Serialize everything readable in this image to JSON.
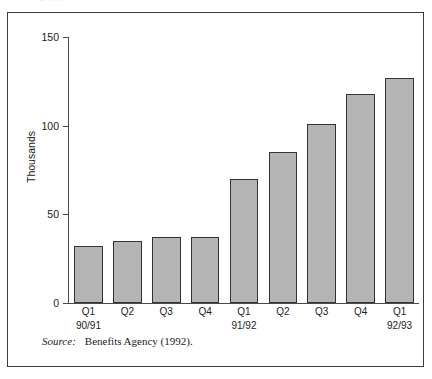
{
  "top_clipped_text": "f.  .  .. .",
  "source": {
    "label": "Source:",
    "text": "Benefits Agency (1992)."
  },
  "chart_data": {
    "type": "bar",
    "title": "",
    "xlabel": "",
    "ylabel": "Thousands",
    "ylim": [
      0,
      150
    ],
    "yticks": [
      0,
      50,
      100,
      150
    ],
    "ytick_labels": [
      "0",
      "50",
      "100",
      "150"
    ],
    "grid": false,
    "legend": null,
    "categories": [
      "Q1",
      "Q2",
      "Q3",
      "Q4",
      "Q1",
      "Q2",
      "Q3",
      "Q4",
      "Q1"
    ],
    "group_labels": [
      "90/91",
      "91/92",
      "92/93"
    ],
    "groups": [
      {
        "label": "90/91",
        "start_index": 0,
        "count": 4
      },
      {
        "label": "91/92",
        "start_index": 4,
        "count": 4
      },
      {
        "label": "92/93",
        "start_index": 8,
        "count": 1
      }
    ],
    "values": [
      32,
      35,
      37.5,
      37.5,
      70,
      85,
      101,
      118,
      127
    ],
    "bar_color": "#b4b4b4",
    "bar_border_color": "#333333",
    "axis_color": "#4a4a4a"
  }
}
